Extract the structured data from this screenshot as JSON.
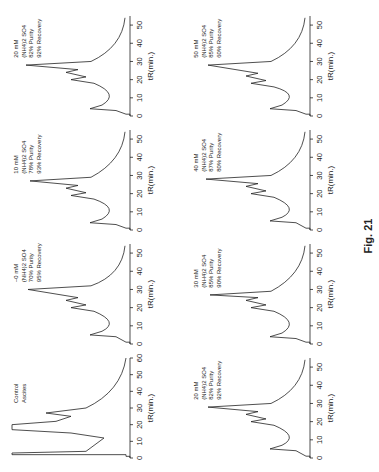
{
  "figure": {
    "caption": "Fig. 21",
    "orientation": "rotated 90° counter-clockwise on page",
    "x_axis_label": "tR(min.)"
  },
  "chart_data": [
    {
      "type": "line",
      "title": "Control Ascites",
      "label_lines": [
        "Control",
        "Ascites"
      ],
      "xlabel": "tR(min.)",
      "xticks": [
        0,
        10,
        20,
        30,
        40,
        50,
        60
      ],
      "xlim": [
        0,
        60
      ],
      "peaks_min": [
        2,
        14,
        26
      ]
    },
    {
      "type": "line",
      "title": "~0 mM (NH4)2SO4",
      "label_lines": [
        "~0 mM",
        "(NH4)2 SO4",
        "70% Purity",
        "95% Recovery"
      ],
      "salt_mM": 0,
      "purity_pct": 70,
      "recovery_pct": 95,
      "xlabel": "tR(min.)",
      "xticks": [
        0,
        10,
        20,
        30,
        40,
        50
      ],
      "xlim": [
        0,
        55
      ],
      "peaks_min": [
        5,
        20,
        24,
        30
      ]
    },
    {
      "type": "line",
      "title": "10 mM (NH4)2SO4",
      "label_lines": [
        "10 mM",
        "(NH4)2 SO4",
        "78% Purity",
        "93% Recovery"
      ],
      "salt_mM": 10,
      "purity_pct": 78,
      "recovery_pct": 93,
      "xlabel": "tR(min.)",
      "xticks": [
        0,
        10,
        20,
        30,
        40,
        50
      ],
      "xlim": [
        0,
        55
      ],
      "peaks_min": [
        4,
        19,
        23,
        27
      ]
    },
    {
      "type": "line",
      "title": "20 mM (NH4)2SO4",
      "label_lines": [
        "20 mM",
        "(NH4)2 SO4",
        "82% Purity",
        "92% Recovery"
      ],
      "salt_mM": 20,
      "purity_pct": 82,
      "recovery_pct": 92,
      "xlabel": "tR(min.)",
      "xticks": [
        0,
        10,
        20,
        30,
        40,
        50
      ],
      "xlim": [
        0,
        55
      ],
      "peaks_min": [
        4,
        20,
        24,
        28
      ]
    },
    {
      "type": "line",
      "title": "20 mM (NH4)2SO4",
      "label_lines": [
        "20 mM",
        "(NH4)2 SO4",
        "82% Purity",
        "92% Recovery"
      ],
      "salt_mM": 20,
      "purity_pct": 82,
      "recovery_pct": 92,
      "xlabel": "tR(min.)",
      "xticks": [
        0,
        10,
        20,
        30,
        40,
        50
      ],
      "xlim": [
        0,
        55
      ],
      "peaks_min": [
        5,
        20,
        24,
        28
      ]
    },
    {
      "type": "line",
      "title": "30 mM (NH4)2SO4",
      "label_lines": [
        "30 mM",
        "(NH4)2 SO4",
        "85% Purity",
        "90% Recovery"
      ],
      "salt_mM": 30,
      "purity_pct": 85,
      "recovery_pct": 90,
      "xlabel": "tR(min.)",
      "xticks": [
        0,
        10,
        20,
        30,
        40,
        50
      ],
      "xlim": [
        0,
        55
      ],
      "peaks_min": [
        4,
        20,
        24,
        27
      ]
    },
    {
      "type": "line",
      "title": "40 mM (NH4)2SO4",
      "label_lines": [
        "40 mM",
        "(NH4)2 SO4",
        "87% Purity",
        "80% Recovery"
      ],
      "salt_mM": 40,
      "purity_pct": 87,
      "recovery_pct": 80,
      "xlabel": "tR(min.)",
      "xticks": [
        0,
        10,
        20,
        30,
        40,
        50
      ],
      "xlim": [
        0,
        55
      ],
      "peaks_min": [
        5,
        20,
        24,
        28
      ]
    },
    {
      "type": "line",
      "title": "50 mM (NH4)2SO4",
      "label_lines": [
        "50 mM",
        "(NH4)2 SO4",
        "85% Purity",
        "60% Recovery"
      ],
      "salt_mM": 50,
      "purity_pct": 85,
      "recovery_pct": 60,
      "xlabel": "tR(min.)",
      "xticks": [
        0,
        10,
        20,
        30,
        40,
        50
      ],
      "xlim": [
        0,
        55
      ],
      "peaks_min": [
        4,
        18,
        22,
        28
      ]
    }
  ]
}
